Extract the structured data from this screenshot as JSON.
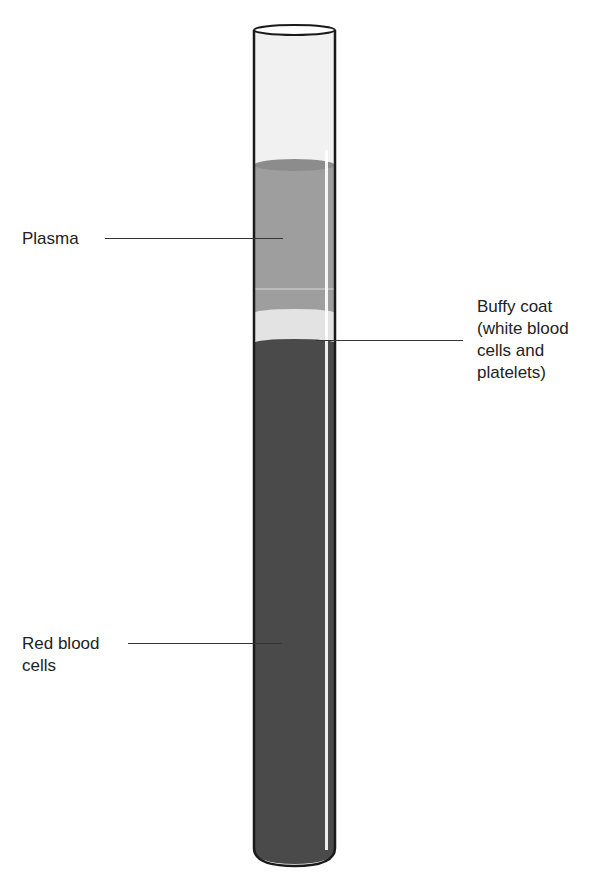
{
  "diagram": {
    "colors": {
      "plasma": "#9e9e9e",
      "buffy_coat": "#e4e4e4",
      "red_blood_cells": "#4a4a4a",
      "tube_empty": "#f2f2f2",
      "outline": "#1a1a1a"
    },
    "labels": {
      "plasma": "Plasma",
      "buffy_coat_line1": "Buffy coat",
      "buffy_coat_line2": "(white blood",
      "buffy_coat_line3": "cells and",
      "buffy_coat_line4": "platelets)",
      "rbc_line1": "Red blood",
      "rbc_line2": "cells"
    }
  }
}
